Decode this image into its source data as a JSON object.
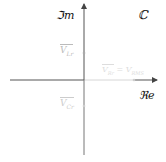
{
  "diagram": {
    "axis_labels": {
      "imaginary": "ℑm",
      "real": "ℜe",
      "plane": "ℂ"
    },
    "points": [
      {
        "name": "V_Lr",
        "label": "V",
        "sub": "Lr",
        "position": "upper-imag"
      },
      {
        "name": "V_Cr",
        "label": "V",
        "sub": "Cr",
        "position": "lower-imag"
      },
      {
        "name": "V_Rr_V_RMS",
        "label": "V",
        "sub": "Rr",
        "eq": "= V",
        "sub2": "RMS",
        "position": "real-axis"
      }
    ],
    "colors": {
      "axis": "#555555",
      "faded_axis": "#cfcfcf",
      "label": "#111111",
      "faded_label": "#c8c8c8"
    }
  }
}
